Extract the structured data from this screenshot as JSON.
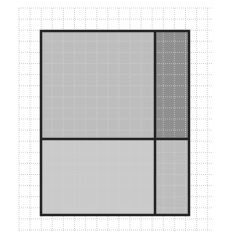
{
  "figure": {
    "grid": {
      "x0": 19,
      "y0": 8,
      "x1": 212,
      "y1": 231,
      "cell_size": 11.1,
      "color": "#d4d4d4"
    },
    "rectangle": {
      "x": 41,
      "y": 31,
      "width": 148,
      "height": 184
    },
    "dividers": {
      "vertical_x": 155,
      "horizontal_y": 139
    },
    "regions": [
      {
        "name": "top-left",
        "color": "#bdbdbd"
      },
      {
        "name": "top-right",
        "color": "#8f8f8f"
      },
      {
        "name": "bottom-left",
        "color": "#cacaca"
      },
      {
        "name": "bottom-right",
        "color": "#bdbdbd"
      }
    ],
    "outline_color": "#222222"
  }
}
